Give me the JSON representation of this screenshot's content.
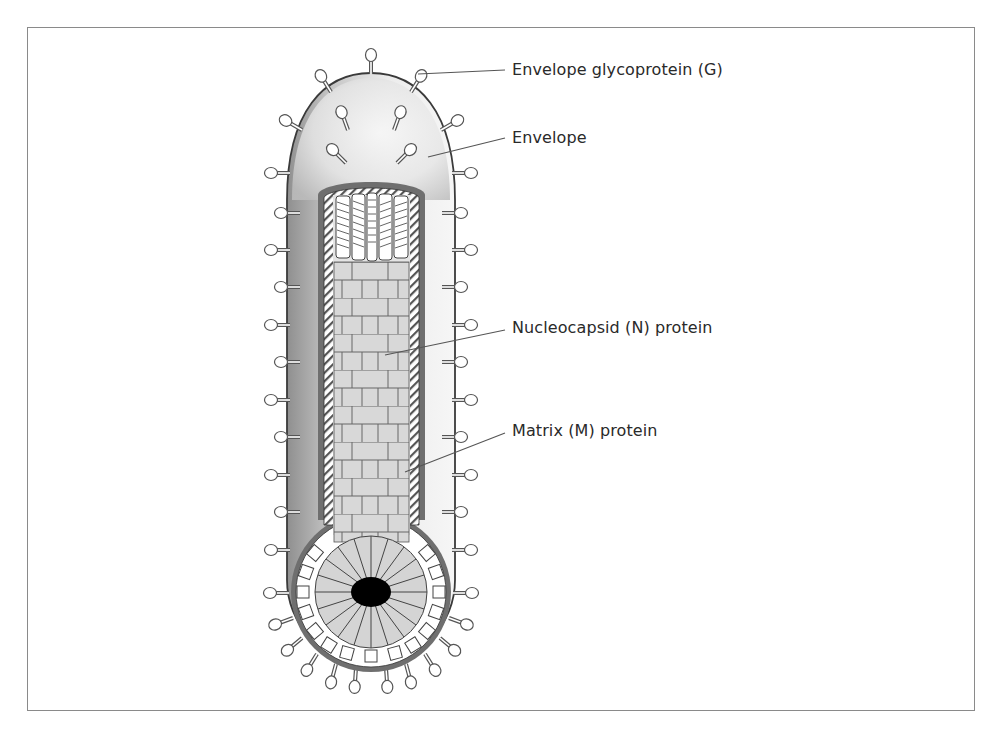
{
  "figure": {
    "labels": [
      {
        "id": "glycoprotein",
        "text": "Envelope glycoprotein (G)",
        "x": 512,
        "y": 60,
        "pointer_from": [
          505,
          70
        ],
        "pointer_to": [
          418,
          74
        ]
      },
      {
        "id": "envelope",
        "text": "Envelope",
        "x": 512,
        "y": 128,
        "pointer_from": [
          505,
          138
        ],
        "pointer_to": [
          428,
          157
        ]
      },
      {
        "id": "nucleocapsid",
        "text": "Nucleocapsid (N) protein",
        "x": 512,
        "y": 318,
        "pointer_from": [
          505,
          330
        ],
        "pointer_to": [
          385,
          355
        ]
      },
      {
        "id": "matrix",
        "text": "Matrix (M) protein",
        "x": 512,
        "y": 421,
        "pointer_from": [
          505,
          433
        ],
        "pointer_to": [
          405,
          472
        ]
      }
    ],
    "colors": {
      "frame": "#8a8a8a",
      "envelope_fill_light": "#f2f2f2",
      "envelope_fill_dark": "#9a9a9a",
      "envelope_outline": "#3a3a3a",
      "membrane_band": "#707070",
      "nucleocapsid_fill": "#d6d6d6",
      "core": "#000000",
      "leader_line": "#555555"
    }
  }
}
